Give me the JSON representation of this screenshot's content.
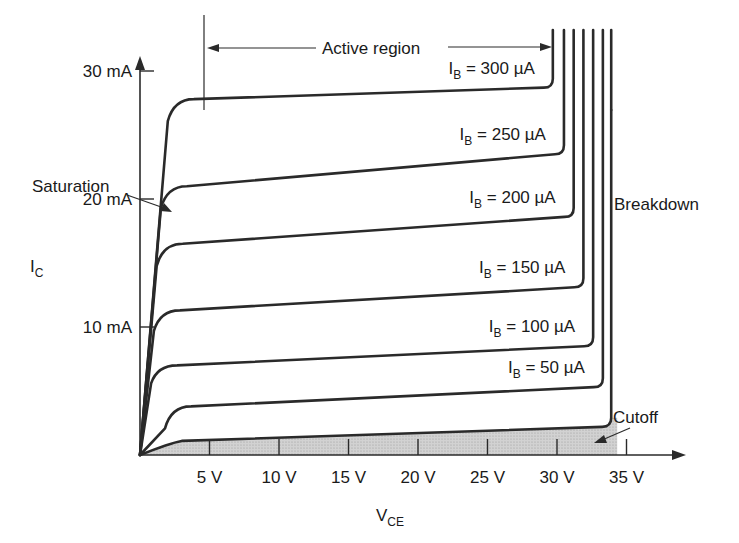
{
  "chart_data": {
    "type": "line",
    "xlabel": "V",
    "xlabel_sub": "CE",
    "ylabel": "I",
    "ylabel_sub": "C",
    "x_ticks": [
      "5 V",
      "10 V",
      "15 V",
      "20 V",
      "25 V",
      "30 V",
      "35 V"
    ],
    "x_tick_values": [
      5,
      10,
      15,
      20,
      25,
      30,
      35
    ],
    "y_ticks": [
      "10 mA",
      "20 mA",
      "30 mA"
    ],
    "y_tick_values": [
      10,
      20,
      30
    ],
    "xlim": [
      0,
      39
    ],
    "ylim": [
      0,
      31
    ],
    "grid": false,
    "series": [
      {
        "name": "I_B = 300 µA",
        "label_main": "I",
        "label_sub": "B",
        "label_rest": " = 300 µA",
        "saturation_v": 2.0,
        "i_start_ma": 27.8,
        "i_end_ma": 28.7,
        "breakdown_v": 29.7
      },
      {
        "name": "I_B = 250 µA",
        "label_main": "I",
        "label_sub": "B",
        "label_rest": " = 250 µA",
        "saturation_v": 1.5,
        "i_start_ma": 21.0,
        "i_end_ma": 23.5,
        "breakdown_v": 30.5
      },
      {
        "name": "I_B = 200 µA",
        "label_main": "I",
        "label_sub": "B",
        "label_rest": " = 200 µA",
        "saturation_v": 1.2,
        "i_start_ma": 16.5,
        "i_end_ma": 18.6,
        "breakdown_v": 31.2
      },
      {
        "name": "I_B = 150 µA",
        "label_main": "I",
        "label_sub": "B",
        "label_rest": " = 150 µA",
        "saturation_v": 1.0,
        "i_start_ma": 11.3,
        "i_end_ma": 13.1,
        "breakdown_v": 31.9
      },
      {
        "name": "I_B = 100 µA",
        "label_main": "I",
        "label_sub": "B",
        "label_rest": " = 100 µA",
        "saturation_v": 0.8,
        "i_start_ma": 7.0,
        "i_end_ma": 8.5,
        "breakdown_v": 32.6
      },
      {
        "name": "I_B = 50 µA",
        "label_main": "I",
        "label_sub": "B",
        "label_rest": " = 50 µA",
        "saturation_v": 1.8,
        "i_start_ma": 3.8,
        "i_end_ma": 5.3,
        "breakdown_v": 33.3
      },
      {
        "name": "Cutoff (I_B = 0)",
        "saturation_v": 3.0,
        "i_start_ma": 1.1,
        "i_end_ma": 2.2,
        "breakdown_v": 33.9
      }
    ],
    "annotations": {
      "active_region": "Active region",
      "saturation": "Saturation",
      "breakdown": "Breakdown",
      "cutoff": "Cutoff"
    }
  },
  "layout": {
    "origin_px": [
      140,
      455
    ],
    "px_per_volt": 13.9,
    "px_per_ma": 12.8,
    "breakdown_top_px": 30,
    "shade_color": "#c8c8c8",
    "line_color": "#2a2a2a"
  }
}
